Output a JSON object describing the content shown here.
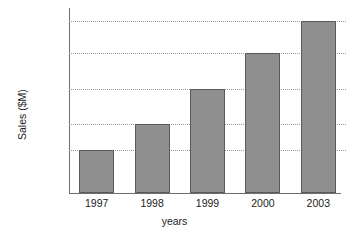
{
  "chart_data": {
    "type": "bar",
    "title": "",
    "xlabel": "years",
    "ylabel": "Sales ($M)",
    "categories": [
      "1997",
      "1998",
      "1999",
      "2000",
      "2003"
    ],
    "values": [
      14820,
      15094,
      15748,
      16724,
      18200
    ],
    "value_labels": [
      "14,820",
      "15,094",
      "15,748",
      "16,724",
      "18,200"
    ],
    "ytick_labels": [
      "18,200",
      "16,724",
      "15,748",
      "15,094",
      "14,820"
    ],
    "ytick_values": [
      18200,
      16724,
      15748,
      15094,
      14820
    ],
    "grid": true,
    "grid_style": "dotted",
    "legend": "none",
    "series": [
      {
        "name": "Sales",
        "values": [
          14820,
          15094,
          15748,
          16724,
          18200
        ]
      }
    ],
    "colors": {
      "bar_fill": "#8f8f8f",
      "bar_edge": "#5a5a5a",
      "gridline": "#9a9a9a",
      "axis": "#6e6e6e",
      "text": "#222222",
      "background": "#ffffff"
    }
  }
}
